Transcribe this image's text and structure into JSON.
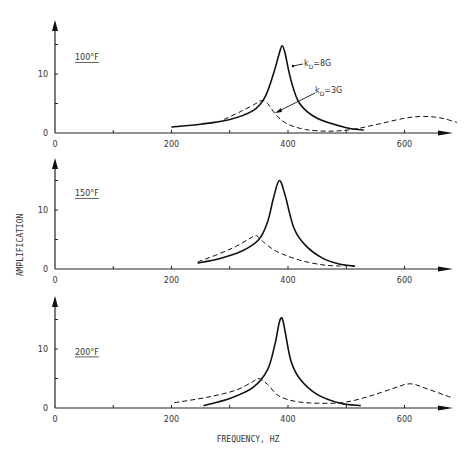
{
  "chart_data": [
    {
      "type": "line",
      "title": "100°F",
      "xlabel": "FREQUENCY, HZ",
      "ylabel": "AMPLIFICATION",
      "xlim": [
        0,
        680
      ],
      "ylim": [
        0,
        17
      ],
      "xticks": [
        0,
        200,
        400,
        600
      ],
      "yticks": [
        0,
        10
      ],
      "grid": false,
      "series": [
        {
          "name": "kD=8G",
          "style": "solid",
          "x": [
            200,
            250,
            300,
            340,
            360,
            375,
            385,
            390,
            395,
            405,
            420,
            450,
            500,
            530
          ],
          "y": [
            1.0,
            1.5,
            2.3,
            3.8,
            6.0,
            10.0,
            13.5,
            14.8,
            13.5,
            9.0,
            5.0,
            2.5,
            0.9,
            0.5
          ]
        },
        {
          "name": "kD=3G",
          "style": "dashed",
          "x": [
            290,
            320,
            345,
            355,
            365,
            380,
            400,
            430,
            470,
            510,
            550,
            600,
            630,
            660,
            690
          ],
          "y": [
            2.3,
            3.7,
            5.0,
            5.5,
            5.0,
            3.0,
            1.5,
            0.6,
            0.3,
            0.6,
            1.4,
            2.5,
            2.8,
            2.6,
            1.8
          ]
        }
      ],
      "annotations": [
        "kD=8G",
        "kD=3G"
      ]
    },
    {
      "type": "line",
      "title": "150°F",
      "xlabel": "",
      "ylabel": "AMPLIFICATION",
      "xlim": [
        0,
        680
      ],
      "ylim": [
        0,
        17
      ],
      "xticks": [
        0,
        200,
        400,
        600
      ],
      "yticks": [
        0,
        10
      ],
      "grid": false,
      "series": [
        {
          "name": "kD=8G",
          "style": "solid",
          "x": [
            245,
            280,
            320,
            350,
            365,
            375,
            385,
            395,
            410,
            430,
            460,
            490,
            515
          ],
          "y": [
            1.0,
            1.7,
            3.0,
            5.0,
            8.0,
            12.0,
            15.0,
            12.5,
            7.0,
            4.0,
            1.8,
            0.8,
            0.5
          ]
        },
        {
          "name": "kD=3G",
          "style": "dashed",
          "x": [
            245,
            280,
            310,
            335,
            345,
            355,
            380,
            420,
            460,
            490
          ],
          "y": [
            1.2,
            2.5,
            3.8,
            5.2,
            5.7,
            4.8,
            3.0,
            1.5,
            0.7,
            0.5
          ]
        }
      ]
    },
    {
      "type": "line",
      "title": "200°F",
      "xlabel": "FREQUENCY, HZ",
      "ylabel": "AMPLIFICATION",
      "xlim": [
        0,
        680
      ],
      "ylim": [
        0,
        17
      ],
      "xticks": [
        0,
        200,
        400,
        600
      ],
      "yticks": [
        0,
        10
      ],
      "grid": false,
      "series": [
        {
          "name": "kD=8G",
          "style": "solid",
          "x": [
            255,
            300,
            340,
            365,
            378,
            385,
            390,
            395,
            405,
            420,
            450,
            490,
            525
          ],
          "y": [
            0.4,
            1.6,
            3.5,
            6.5,
            11.0,
            14.5,
            15.2,
            13.0,
            8.0,
            5.0,
            2.3,
            0.8,
            0.4
          ]
        },
        {
          "name": "kD=3G",
          "style": "dashed",
          "x": [
            205,
            260,
            310,
            340,
            350,
            365,
            385,
            420,
            470,
            500,
            540,
            580,
            610,
            640,
            680
          ],
          "y": [
            0.9,
            1.8,
            3.0,
            4.5,
            5.0,
            4.0,
            2.0,
            1.0,
            0.8,
            1.0,
            2.0,
            3.3,
            4.1,
            3.2,
            1.8
          ]
        }
      ]
    }
  ],
  "panels": [
    {
      "label": "100°F",
      "annot_8g": "k",
      "annot_8g_sub": "D",
      "annot_8g_val": "=8G",
      "annot_3g": "k",
      "annot_3g_sub": "D",
      "annot_3g_val": "=3G"
    },
    {
      "label": "150°F"
    },
    {
      "label": "200°F"
    }
  ],
  "axes": {
    "xlabel": "FREQUENCY, HZ",
    "ylabel": "AMPLIFICATION",
    "xtick_labels": [
      "0",
      "200",
      "400",
      "600"
    ],
    "ytick_labels": [
      "0",
      "10"
    ]
  }
}
